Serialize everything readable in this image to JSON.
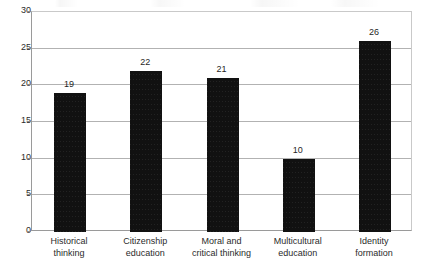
{
  "chart_data": {
    "type": "bar",
    "title": "",
    "xlabel": "",
    "ylabel": "",
    "ylim": [
      0,
      30
    ],
    "ytick_step": 5,
    "yticks": [
      0,
      5,
      10,
      15,
      20,
      25,
      30
    ],
    "ytick_labels": [
      "0",
      "5",
      "10",
      "15",
      "20",
      "25",
      "30"
    ],
    "grid": true,
    "legend": false,
    "orientation": "vertical",
    "bar_color": "#111111",
    "gridline_color": "#b2b2b2",
    "background_color": "#ffffff",
    "categories": [
      "Historical thinking",
      "Citizenship education",
      "Moral and critical thinking",
      "Multicultural education",
      "Identity formation"
    ],
    "category_lines": [
      [
        "Historical",
        "thinking"
      ],
      [
        "Citizenship",
        "education"
      ],
      [
        "Moral and",
        "critical thinking"
      ],
      [
        "Multicultural",
        "education"
      ],
      [
        "Identity",
        "formation"
      ]
    ],
    "values": [
      19,
      22,
      21,
      10,
      26
    ],
    "value_labels": [
      "19",
      "22",
      "21",
      "10",
      "26"
    ]
  }
}
